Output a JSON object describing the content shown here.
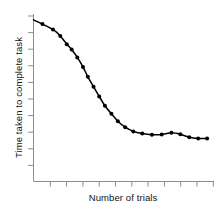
{
  "chart_data": {
    "type": "line",
    "title": "",
    "subtitle": "",
    "xlabel": "Number of trials",
    "ylabel": "Time taken to complete task",
    "grid": false,
    "legend": null,
    "axis_tick_labels": {
      "x": [],
      "y": []
    },
    "x_tick_count": 11,
    "y_tick_count": 10,
    "xlim": [
      0,
      22
    ],
    "ylim": [
      0,
      100
    ],
    "annotations": [],
    "series": [
      {
        "name": "Time to complete task",
        "color": "#000000",
        "marker": "filled-circle",
        "x": [
          0.0,
          1.1,
          2.4,
          3.3,
          4.1,
          4.7,
          5.4,
          6.1,
          6.7,
          7.4,
          8.1,
          8.8,
          9.6,
          10.4,
          11.3,
          12.3,
          13.4,
          14.6,
          15.8,
          17.0,
          18.1,
          19.2,
          20.3,
          21.4
        ],
        "values": [
          96.5,
          94.0,
          90.8,
          86.9,
          82.0,
          78.8,
          74.1,
          68.4,
          62.5,
          56.6,
          50.8,
          45.2,
          40.4,
          36.0,
          32.4,
          29.9,
          28.6,
          27.9,
          28.0,
          29.1,
          28.2,
          26.4,
          25.7,
          25.7
        ]
      }
    ]
  },
  "labels": {
    "y_axis_title": "Time taken to complete task",
    "x_axis_title": "Number of trials"
  },
  "style": {
    "line_color": "#000000",
    "marker_color": "#000000",
    "axis_color": "#8d8d8d",
    "text_color": "#111111",
    "background": "#ffffff"
  }
}
